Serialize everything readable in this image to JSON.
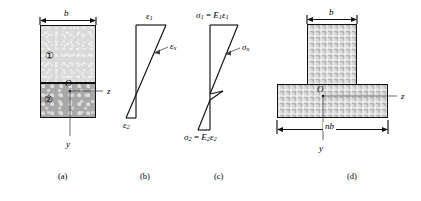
{
  "panels": [
    {
      "id": "a",
      "caption": "(a)",
      "name": "cross-section-panel",
      "description": "Two-material rectangular cross section",
      "dimension_label": "b",
      "material_labels": [
        "①",
        "②"
      ],
      "origin_label": "O",
      "axis_z": "z",
      "axis_y": "y"
    },
    {
      "id": "b",
      "caption": "(b)",
      "name": "strain-distribution-panel",
      "description": "Linear strain distribution through the depth",
      "top_label": "ε",
      "top_sub": "1",
      "bottom_label": "ε",
      "bottom_sub": "2",
      "curve_label": "ε",
      "curve_sub": "x"
    },
    {
      "id": "c",
      "caption": "(c)",
      "name": "stress-distribution-panel",
      "description": "Discontinuous stress distribution at the material interface",
      "top_label_sigma": "σ",
      "top_label_sub": "1",
      "top_label_eq": " = ",
      "top_label_E": "E",
      "top_label_E_sub": "1",
      "top_label_eps": "ε",
      "top_label_eps_sub": "1",
      "bottom_label_sigma": "σ",
      "bottom_label_sub": "2",
      "bottom_label_eq": " = ",
      "bottom_label_E": "E",
      "bottom_label_E_sub": "2",
      "bottom_label_eps": "ε",
      "bottom_label_eps_sub": "2",
      "curve_label": "σ",
      "curve_sub": "x"
    },
    {
      "id": "d",
      "caption": "(d)",
      "name": "transformed-section-panel",
      "description": "Transformed T-shaped section",
      "top_dimension_label": "b",
      "bottom_dimension_label": "nb",
      "origin_label": "O",
      "axis_z": "z",
      "axis_y": "y"
    }
  ],
  "colors": {
    "line": "#111111",
    "material_one_fill": "#d9d9d9",
    "material_two_fill": "#a8a8a8",
    "transformed_fill": "#b5b5b5",
    "leader_line": "#555555",
    "background": "#ffffff"
  }
}
